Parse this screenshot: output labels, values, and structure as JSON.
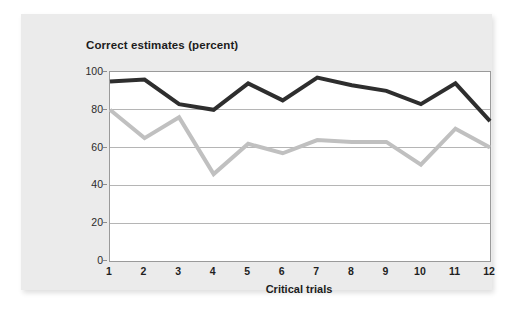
{
  "chart_data": {
    "type": "line",
    "title": "Correct estimates (percent)",
    "xlabel": "Critical trials",
    "ylabel": "",
    "categories": [
      "1",
      "2",
      "3",
      "4",
      "5",
      "6",
      "7",
      "8",
      "9",
      "10",
      "11",
      "12"
    ],
    "x": [
      1,
      2,
      3,
      4,
      5,
      6,
      7,
      8,
      9,
      10,
      11,
      12
    ],
    "ylim": [
      0,
      100
    ],
    "xlim": [
      1,
      12
    ],
    "yticks": [
      0,
      20,
      40,
      60,
      80,
      100
    ],
    "ytick_labels": [
      "0",
      "20",
      "40",
      "60",
      "80",
      "100"
    ],
    "grid": "horizontal",
    "legend": "none",
    "series": [
      {
        "name": "dark-series",
        "color": "#2e2e2e",
        "line_width": 4,
        "values": [
          95,
          96,
          83,
          80,
          94,
          85,
          97,
          93,
          90,
          83,
          94,
          74
        ]
      },
      {
        "name": "light-series",
        "color": "#c0c0c0",
        "line_width": 4,
        "values": [
          80,
          65,
          76,
          46,
          62,
          57,
          64,
          63,
          63,
          51,
          70,
          60
        ]
      }
    ]
  },
  "figure": {
    "panel_color": "#ebebeb",
    "plot_background": "#ffffff",
    "gridline_color": "#b5b5b5",
    "axis_color": "#9a9a9a",
    "text_color": "#1c1c1c"
  }
}
